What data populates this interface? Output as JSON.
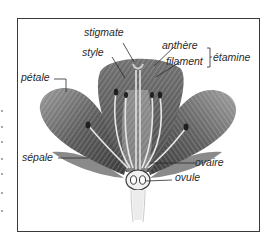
{
  "diagram": {
    "language": "French",
    "labels": {
      "stigmate": "stigmate",
      "style": "style",
      "anthere": "anthère",
      "filament": "filament",
      "etamine": "étamine",
      "petale": "pétale",
      "sepale": "sépale",
      "ovaire": "ovaire",
      "ovule": "ovule"
    },
    "groupings": [
      {
        "group": "étamine",
        "members": [
          "anthère",
          "filament"
        ]
      }
    ],
    "colors": {
      "frame": "#3a3a3a",
      "petal_dark": "#4a4a4a",
      "petal_mid": "#7a7a7a",
      "petal_light": "#b5b5b5",
      "organ_light": "#e8e8e8",
      "text": "#2a2a2a"
    }
  }
}
